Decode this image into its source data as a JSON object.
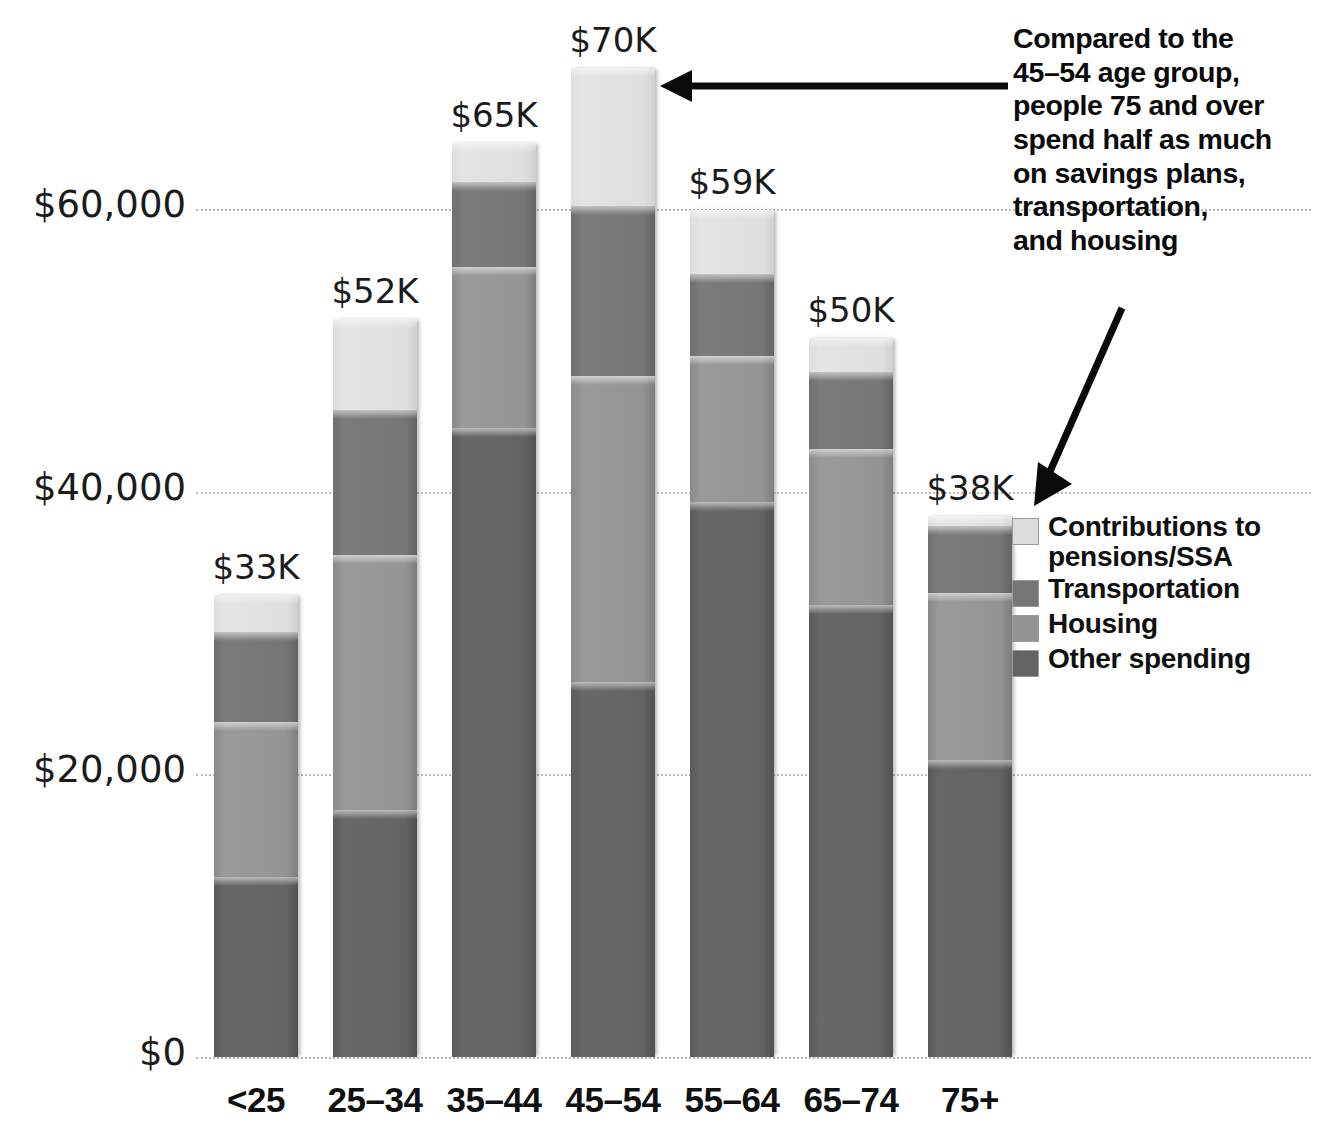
{
  "chart_data": {
    "type": "bar",
    "subtype": "stacked-bar",
    "title": "",
    "xlabel": "",
    "ylabel": "",
    "ylim": [
      0,
      70000
    ],
    "grid": true,
    "grid_axis": "y",
    "legend_position": "right",
    "categories": [
      "<25",
      "25–34",
      "35–44",
      "45–54",
      "55–64",
      "65–74",
      "75+"
    ],
    "y_ticks": [
      0,
      20000,
      40000,
      60000
    ],
    "y_tick_labels": [
      "$0",
      "$20,000",
      "$40,000",
      "$60,000"
    ],
    "bar_total_labels": [
      "$33K",
      "$52K",
      "$65K",
      "$70K",
      "$59K",
      "$50K",
      "$38K"
    ],
    "totals": [
      33000,
      52000,
      65000,
      70000,
      59000,
      50000,
      38000
    ],
    "series": [
      {
        "name": "Contributions to pensions/SSA",
        "color": "#dcdcdc",
        "values": [
          2600,
          6400,
          2800,
          9800,
          4500,
          2400,
          700
        ]
      },
      {
        "name": "Transportation",
        "color": "#767676",
        "values": [
          6400,
          10300,
          6000,
          12000,
          5800,
          5500,
          4800
        ]
      },
      {
        "name": "Housing",
        "color": "#949494",
        "values": [
          11000,
          18000,
          11400,
          21700,
          10300,
          11000,
          11800
        ]
      },
      {
        "name": "Other spending",
        "color": "#636363",
        "values": [
          12700,
          17500,
          44500,
          26500,
          39300,
          32000,
          21000
        ]
      }
    ]
  },
  "legend": {
    "items": [
      {
        "label": "Contributions to",
        "label2": "pensions/SSA",
        "color": "#dcdcdc"
      },
      {
        "label": "Transportation",
        "label2": "",
        "color": "#767676"
      },
      {
        "label": "Housing",
        "label2": "",
        "color": "#949494"
      },
      {
        "label": "Other spending",
        "label2": "",
        "color": "#636363"
      }
    ]
  },
  "annotation": {
    "lines": [
      "Compared to the",
      "45–54 age group,",
      "people 75 and over",
      "spend half as much",
      "on savings plans,",
      "transportation,",
      "and housing"
    ]
  },
  "colors": {
    "text": "#101010",
    "gridline": "#b9b9b9",
    "background": "#ffffff"
  }
}
